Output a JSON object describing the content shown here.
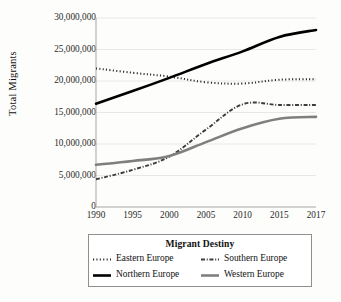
{
  "chart_data": {
    "type": "line",
    "title": "",
    "xlabel": "",
    "ylabel": "Total Migrants",
    "x": [
      1990,
      1995,
      2000,
      2005,
      2010,
      2015,
      2017
    ],
    "xticklabels": [
      "1990",
      "1995",
      "2000",
      "2005",
      "2010",
      "2015",
      "2017"
    ],
    "yticklabels": [
      "0",
      "5,000,000",
      "10,000,000",
      "15,000,000",
      "20,000,000",
      "25,000,000",
      "30,000,000"
    ],
    "ytickvalues": [
      0,
      5000000,
      10000000,
      15000000,
      20000000,
      25000000,
      30000000
    ],
    "ylim": [
      0,
      30000000
    ],
    "xlim": [
      1990,
      2017
    ],
    "grid": "horizontal",
    "legend_position": "bottom",
    "legend_title": "Migrant Destiny",
    "series": [
      {
        "name": "Eastern Europe",
        "style": "dotted",
        "color": "#262626",
        "width": 2.0,
        "values": [
          22000000,
          21300000,
          20700000,
          19800000,
          19600000,
          20200000,
          20300000
        ]
      },
      {
        "name": "Northern Europe",
        "style": "solid",
        "color": "#000000",
        "width": 2.6,
        "values": [
          16400000,
          18400000,
          20500000,
          22700000,
          24700000,
          27000000,
          28100000
        ]
      },
      {
        "name": "Southern Europe",
        "style": "dashdot",
        "color": "#3d3d3d",
        "width": 1.9,
        "values": [
          4400000,
          5900000,
          8000000,
          12300000,
          16300000,
          16200000,
          16200000
        ]
      },
      {
        "name": "Western Europe",
        "style": "solid",
        "color": "#7f7f7f",
        "width": 2.6,
        "values": [
          6700000,
          7300000,
          8100000,
          10300000,
          12500000,
          14000000,
          14300000
        ]
      }
    ]
  },
  "legend": {
    "title": "Migrant Destiny",
    "entries": [
      {
        "label": "Eastern Europe"
      },
      {
        "label": "Southern Europe"
      },
      {
        "label": "Northern Europe"
      },
      {
        "label": "Western Europe"
      }
    ]
  }
}
